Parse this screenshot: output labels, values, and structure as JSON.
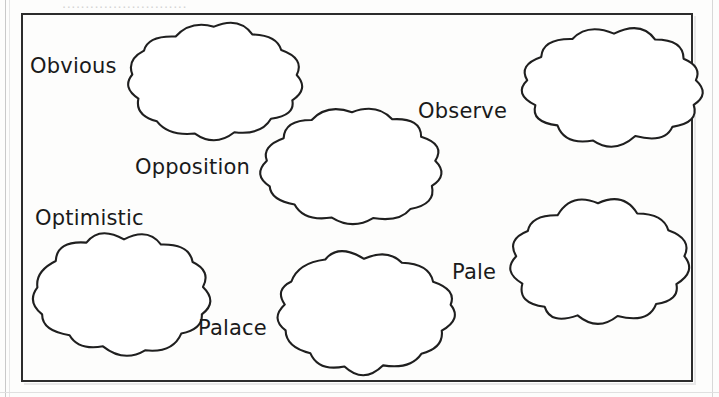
{
  "worksheet": {
    "header_ghost": "...........................",
    "frame_label": "cloud-word-frame",
    "background_color": "#fdfdfc",
    "ink_color": "#1f1f1f"
  },
  "words": [
    {
      "id": "obvious",
      "text": "Obvious",
      "x": 30,
      "y": 54
    },
    {
      "id": "opposition",
      "text": "Opposition",
      "x": 135,
      "y": 155
    },
    {
      "id": "observe",
      "text": "Observe",
      "x": 418,
      "y": 99
    },
    {
      "id": "optimistic",
      "text": "Optimistic",
      "x": 35,
      "y": 206
    },
    {
      "id": "palace",
      "text": "Palace",
      "x": 198,
      "y": 316
    },
    {
      "id": "pale",
      "text": "Pale",
      "x": 452,
      "y": 260
    }
  ],
  "clouds": [
    {
      "id": "cloud-top-left",
      "x": 120,
      "y": 23,
      "w": 188,
      "h": 116
    },
    {
      "id": "cloud-top-middle",
      "x": 256,
      "y": 107,
      "w": 192,
      "h": 120
    },
    {
      "id": "cloud-top-right",
      "x": 518,
      "y": 27,
      "w": 192,
      "h": 120
    },
    {
      "id": "cloud-bottom-left",
      "x": 30,
      "y": 231,
      "w": 188,
      "h": 126
    },
    {
      "id": "cloud-bottom-middle",
      "x": 270,
      "y": 249,
      "w": 188,
      "h": 125
    },
    {
      "id": "cloud-bottom-right",
      "x": 503,
      "y": 199,
      "w": 190,
      "h": 128
    }
  ]
}
